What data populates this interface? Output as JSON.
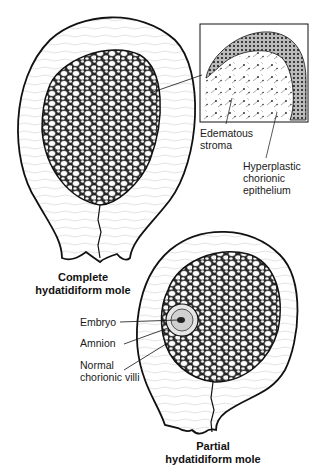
{
  "figures": [
    {
      "id": "complete",
      "title_line1": "Complete",
      "title_line2": "hydatidiform mole"
    },
    {
      "id": "partial",
      "title_line1": "Partial",
      "title_line2": "hydatidiform mole"
    }
  ],
  "inset_labels": {
    "stroma": [
      "Edematous",
      "stroma"
    ],
    "epithelium": [
      "Hyperplastic",
      "chorionic",
      "epithelium"
    ]
  },
  "partial_labels": {
    "embryo": "Embryo",
    "amnion": "Amnion",
    "villi": [
      "Normal",
      "chorionic villi"
    ]
  },
  "colors": {
    "ink": "#111111",
    "background": "#ffffff",
    "wall_fill": "#f4f4f4"
  }
}
